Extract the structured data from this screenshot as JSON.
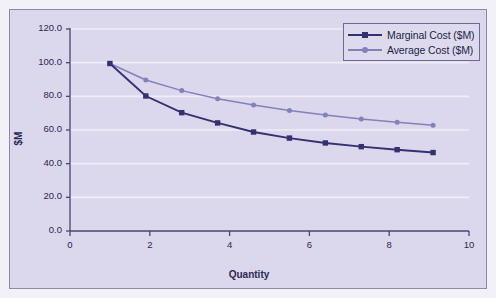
{
  "chart_data": {
    "type": "line",
    "title": "",
    "xlabel": "Quantity",
    "ylabel": "$M",
    "xlim": [
      0,
      10
    ],
    "ylim": [
      0,
      120
    ],
    "grid": true,
    "legend_position": "top-right",
    "x_ticks": [
      "0",
      "2",
      "4",
      "6",
      "8",
      "10"
    ],
    "x_tick_values": [
      0,
      2,
      4,
      6,
      8,
      10
    ],
    "y_ticks": [
      "0.0",
      "20.0",
      "40.0",
      "60.0",
      "80.0",
      "100.0",
      "120.0"
    ],
    "y_tick_values": [
      0,
      20,
      40,
      60,
      80,
      100,
      120
    ],
    "x": [
      1.0,
      1.9,
      2.8,
      3.7,
      4.6,
      5.5,
      6.4,
      7.3,
      8.2,
      9.1
    ],
    "series": [
      {
        "name": "Marginal Cost ($M)",
        "color": "#353070",
        "marker": "square",
        "values": [
          99.5,
          80.2,
          70.3,
          64.2,
          58.8,
          55.2,
          52.3,
          50.1,
          48.3,
          46.6
        ]
      },
      {
        "name": "Average Cost ($M)",
        "color": "#8480bb",
        "marker": "circle",
        "values": [
          99.5,
          89.7,
          83.4,
          78.6,
          74.8,
          71.6,
          68.9,
          66.6,
          64.6,
          62.8
        ]
      }
    ],
    "colors": {
      "plot_background": "#dbd7ec",
      "frame_border": "#8d88ae",
      "axis": "#4b4572",
      "gridline": "#efedf7",
      "text": "#2c2752",
      "page_background": "#f2f1f7"
    }
  }
}
